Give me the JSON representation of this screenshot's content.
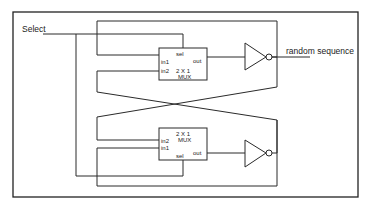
{
  "diagram": {
    "select_label": "Select",
    "output_label": "random sequence",
    "mux_top": {
      "sel": "sel",
      "out": "out",
      "in1": "in1",
      "in2": "in2",
      "title_line1": "2 X 1",
      "title_line2": "MUX"
    },
    "mux_bottom": {
      "sel": "sel",
      "out": "out",
      "in1": "in1",
      "in2": "in2",
      "title_line1": "2 X 1",
      "title_line2": "MUX"
    },
    "components": [
      "mux-2x1-top",
      "inverter-top",
      "mux-2x1-bottom",
      "inverter-bottom"
    ],
    "colors": {
      "line": "#2a2a2a",
      "background": "#ffffff"
    }
  }
}
